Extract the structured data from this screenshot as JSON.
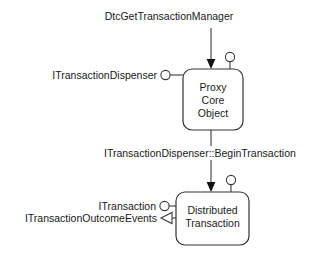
{
  "diagram": {
    "title_label": "DtcGetTransactionManager",
    "mid_label": "ITransactionDispenser::BeginTransaction",
    "nodes": [
      {
        "id": "proxy-core-object",
        "lines": [
          "Proxy",
          "Core",
          "Object"
        ]
      },
      {
        "id": "distributed-transaction",
        "lines": [
          "Distributed",
          "Transaction"
        ]
      }
    ],
    "interfaces": [
      {
        "id": "itransactiondispenser",
        "label": "ITransactionDispenser",
        "kind": "provided-lollipop"
      },
      {
        "id": "itransaction",
        "label": "ITransaction",
        "kind": "provided-lollipop"
      },
      {
        "id": "itransactionoutcomeevents",
        "label": "ITransactionOutcomeEvents",
        "kind": "outgoing-arrow"
      }
    ],
    "colors": {
      "background": "#ffffff",
      "stroke": "#3a3a3a",
      "text": "#1a1a1a",
      "box_stroke": "#333333"
    }
  }
}
